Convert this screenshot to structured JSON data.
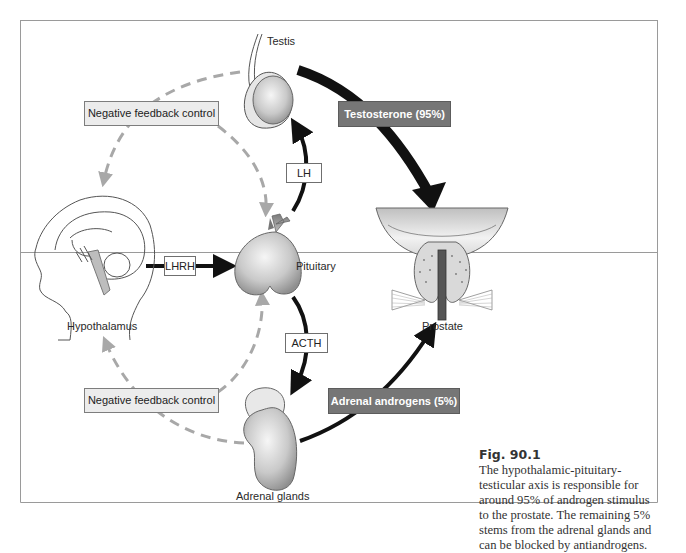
{
  "figure": {
    "number": "Fig. 90.1",
    "caption": "The hypothalamic-pituitary-testicular axis is responsible for around 95% of androgen stimulus to the prostate. The remaining 5% stems from the adrenal glands and can be blocked by antiandrogens."
  },
  "organs": {
    "testis": "Testis",
    "pituitary": "Pituitary",
    "hypothalamus": "Hypothalamus",
    "adrenal": "Adrenal glands",
    "prostate": "Prostate"
  },
  "hormones": {
    "lhrh": "LHRH",
    "lh": "LH",
    "acth": "ACTH",
    "testosterone": "Testosterone (95%)",
    "adrenal_androgens": "Adrenal androgens (5%)"
  },
  "feedback": {
    "top": "Negative feedback control",
    "bottom": "Negative feedback control"
  },
  "colors": {
    "arrow": "#111111",
    "dashed_feedback": "#a8a8a8",
    "dark_label_bg": "#767676",
    "light_label_bg": "#ececec",
    "organ_fill": "#c8c8c8"
  }
}
